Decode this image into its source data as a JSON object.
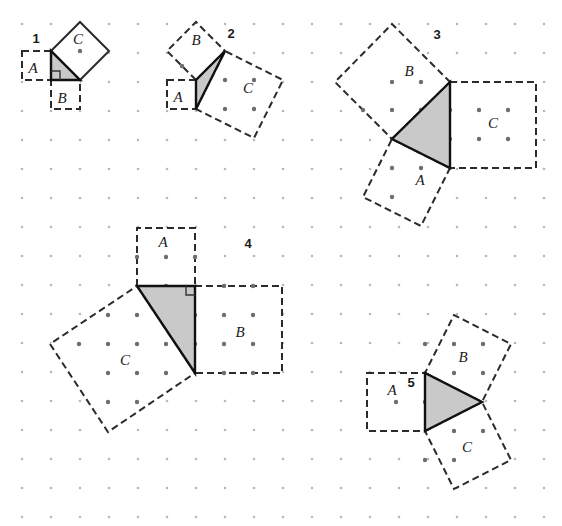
{
  "canvas": {
    "width": 562,
    "height": 526,
    "background": "#ffffff"
  },
  "grid": {
    "description": "square dot lattice",
    "spacing": 29,
    "origin_x": 22,
    "origin_y": 24,
    "cols": 19,
    "rows": 18,
    "dot_radius_faint": 1.3,
    "dot_radius_strong": 2.2,
    "color_faint": "#b9b9b9",
    "color_strong": "#6e6e6e"
  },
  "style": {
    "triangle_fill": "#c9c9c9",
    "triangle_stroke": "#111111",
    "triangle_stroke_width": 2.4,
    "square_stroke": "#2b2b2b",
    "square_stroke_width": 2.0,
    "square_fill": "#ffffff",
    "dash_pattern": "7,4",
    "solid_pattern": "none",
    "right_angle_stroke": "#333333"
  },
  "figures": [
    {
      "id": "figure-1",
      "number": "1",
      "number_pos": {
        "x": 36,
        "y": 43
      },
      "triangle": {
        "points": "51,51 51,80 80,80",
        "right_angle": {
          "corner": "51,80",
          "size": 9,
          "dir": "ne"
        }
      },
      "squares": [
        {
          "label": "A",
          "label_pos": {
            "x": 33,
            "y": 73
          },
          "points": "22,51 51,51 51,80 22,80",
          "dashed": true
        },
        {
          "label": "B",
          "label_pos": {
            "x": 62,
            "y": 103
          },
          "points": "51,80 80,80 80,109 51,109",
          "dashed": true
        },
        {
          "label": "C",
          "label_pos": {
            "x": 78,
            "y": 44
          },
          "points": "51,51 80,22 109,51 80,80",
          "dashed": false
        }
      ],
      "dots": [
        {
          "x": 80,
          "y": 51
        }
      ]
    },
    {
      "id": "figure-2",
      "number": "2",
      "number_pos": {
        "x": 231,
        "y": 38
      },
      "triangle": {
        "points": "196,80 196,109 225,51",
        "right_angle": null
      },
      "squares": [
        {
          "label": "A",
          "label_pos": {
            "x": 178,
            "y": 102
          },
          "points": "167,80 196,80 196,109 167,109",
          "dashed": true
        },
        {
          "label": "B",
          "label_pos": {
            "x": 196,
            "y": 45
          },
          "points": "196,80 167,51 196,22 225,51",
          "dashed": true
        },
        {
          "label": "C",
          "label_pos": {
            "x": 248,
            "y": 93
          },
          "points": "196,109 225,51 283,80 254,138",
          "dashed": true
        }
      ],
      "dots": [
        {
          "x": 225,
          "y": 80
        },
        {
          "x": 254,
          "y": 80
        },
        {
          "x": 225,
          "y": 109
        },
        {
          "x": 254,
          "y": 109
        },
        {
          "x": 182,
          "y": 66
        }
      ]
    },
    {
      "id": "figure-3",
      "number": "3",
      "number_pos": {
        "x": 437,
        "y": 39
      },
      "triangle": {
        "points": "450,82 450,168 392,139",
        "right_angle": null
      },
      "squares": [
        {
          "label": "A",
          "label_pos": {
            "x": 420,
            "y": 185
          },
          "points": "450,168 392,139 363,197 421,226",
          "dashed": true
        },
        {
          "label": "B",
          "label_pos": {
            "x": 409,
            "y": 76
          },
          "points": "450,82 392,139 335,82 392,24",
          "dashed": true
        },
        {
          "label": "C",
          "label_pos": {
            "x": 493,
            "y": 128
          },
          "points": "450,82 536,82 536,168 450,168",
          "dashed": true
        }
      ],
      "dots": [
        {
          "x": 421,
          "y": 110
        },
        {
          "x": 421,
          "y": 139
        },
        {
          "x": 450,
          "y": 110
        },
        {
          "x": 450,
          "y": 139
        },
        {
          "x": 479,
          "y": 110
        },
        {
          "x": 479,
          "y": 139
        },
        {
          "x": 508,
          "y": 110
        },
        {
          "x": 508,
          "y": 139
        },
        {
          "x": 392,
          "y": 82
        },
        {
          "x": 421,
          "y": 82
        },
        {
          "x": 363,
          "y": 110
        },
        {
          "x": 392,
          "y": 110
        },
        {
          "x": 392,
          "y": 168
        },
        {
          "x": 421,
          "y": 168
        },
        {
          "x": 392,
          "y": 197
        }
      ]
    },
    {
      "id": "figure-4",
      "number": "4",
      "number_pos": {
        "x": 248,
        "y": 248
      },
      "triangle": {
        "points": "137,286 195,286 195,373",
        "right_angle": {
          "corner": "195,286",
          "size": 9,
          "dir": "sw"
        }
      },
      "squares": [
        {
          "label": "A",
          "label_pos": {
            "x": 163,
            "y": 247
          },
          "points": "137,286 137,228 195,228 195,286",
          "dashed": true
        },
        {
          "label": "B",
          "label_pos": {
            "x": 240,
            "y": 337
          },
          "points": "195,286 282,286 282,373 195,373",
          "dashed": true
        },
        {
          "label": "C",
          "label_pos": {
            "x": 125,
            "y": 365
          },
          "points": "137,286 195,373 108,432 50,344",
          "dashed": true
        }
      ],
      "dots": [
        {
          "x": 166,
          "y": 257
        },
        {
          "x": 108,
          "y": 315
        },
        {
          "x": 137,
          "y": 315
        },
        {
          "x": 166,
          "y": 315
        },
        {
          "x": 79,
          "y": 344
        },
        {
          "x": 108,
          "y": 344
        },
        {
          "x": 137,
          "y": 344
        },
        {
          "x": 166,
          "y": 344
        },
        {
          "x": 108,
          "y": 373
        },
        {
          "x": 137,
          "y": 373
        },
        {
          "x": 166,
          "y": 373
        },
        {
          "x": 108,
          "y": 402
        },
        {
          "x": 137,
          "y": 402
        },
        {
          "x": 195,
          "y": 315
        },
        {
          "x": 195,
          "y": 344
        },
        {
          "x": 224,
          "y": 315
        },
        {
          "x": 253,
          "y": 315
        },
        {
          "x": 224,
          "y": 344
        },
        {
          "x": 253,
          "y": 344
        },
        {
          "x": 166,
          "y": 286
        },
        {
          "x": 224,
          "y": 286
        },
        {
          "x": 253,
          "y": 286
        },
        {
          "x": 224,
          "y": 373
        },
        {
          "x": 253,
          "y": 373
        },
        {
          "x": 137,
          "y": 257
        },
        {
          "x": 195,
          "y": 257
        }
      ]
    },
    {
      "id": "figure-5",
      "number": "5",
      "number_pos": {
        "x": 411,
        "y": 387
      },
      "triangle": {
        "points": "425,373 425,431 482,402",
        "right_angle": null
      },
      "squares": [
        {
          "label": "A",
          "label_pos": {
            "x": 392,
            "y": 395
          },
          "points": "367,373 425,373 425,431 367,431",
          "dashed": true
        },
        {
          "label": "B",
          "label_pos": {
            "x": 463,
            "y": 362
          },
          "points": "425,373 482,402 511,344 454,315",
          "dashed": true
        },
        {
          "label": "C",
          "label_pos": {
            "x": 467,
            "y": 452
          },
          "points": "425,431 482,402 511,460 454,489",
          "dashed": true
        }
      ],
      "dots": [
        {
          "x": 396,
          "y": 402
        },
        {
          "x": 425,
          "y": 402
        },
        {
          "x": 454,
          "y": 373
        },
        {
          "x": 483,
          "y": 373
        },
        {
          "x": 454,
          "y": 402
        },
        {
          "x": 454,
          "y": 431
        },
        {
          "x": 483,
          "y": 431
        },
        {
          "x": 425,
          "y": 344
        },
        {
          "x": 454,
          "y": 344
        },
        {
          "x": 483,
          "y": 344
        },
        {
          "x": 425,
          "y": 460
        },
        {
          "x": 454,
          "y": 460
        }
      ]
    }
  ]
}
